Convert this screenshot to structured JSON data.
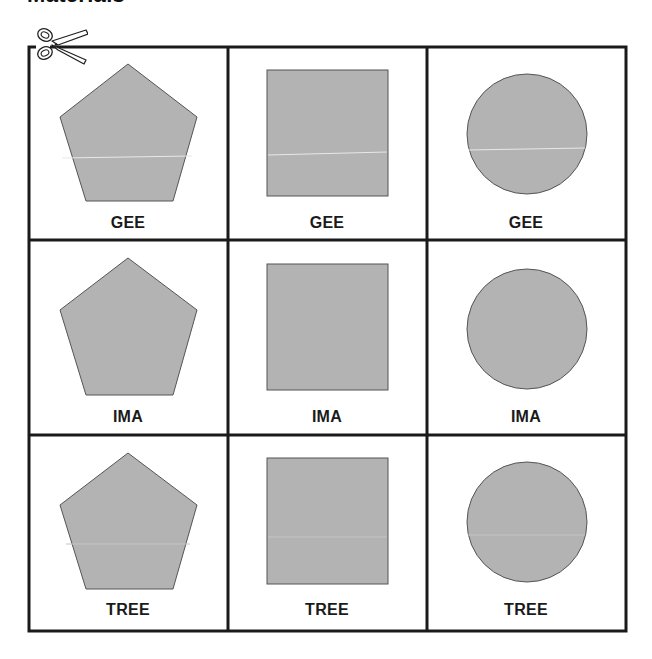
{
  "page": {
    "title": "Materials"
  },
  "colors": {
    "shape_fill": "#b3b3b3",
    "shape_stroke": "#555555",
    "grid_line": "#1a1a1a",
    "label": "#1a1a1a"
  },
  "cut_icon": "scissors-icon",
  "cards": [
    {
      "shape": "pentagon",
      "label": "GEE"
    },
    {
      "shape": "square",
      "label": "GEE"
    },
    {
      "shape": "circle",
      "label": "GEE"
    },
    {
      "shape": "pentagon",
      "label": "IMA"
    },
    {
      "shape": "square",
      "label": "IMA"
    },
    {
      "shape": "circle",
      "label": "IMA"
    },
    {
      "shape": "pentagon",
      "label": "TREE"
    },
    {
      "shape": "square",
      "label": "TREE"
    },
    {
      "shape": "circle",
      "label": "TREE"
    }
  ]
}
